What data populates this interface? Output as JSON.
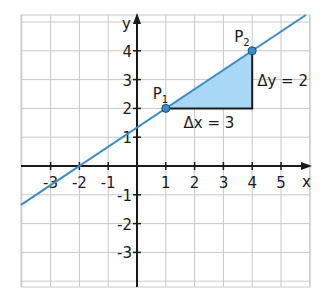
{
  "chart_data": {
    "type": "line",
    "title": "",
    "xlabel": "x",
    "ylabel": "y",
    "xlim": [
      -4.0,
      6.0
    ],
    "ylim": [
      -4.2,
      5.0
    ],
    "grid": true,
    "x_ticks": [
      -3,
      -2,
      -1,
      1,
      2,
      3,
      4,
      5
    ],
    "y_ticks": [
      -3,
      -2,
      -1,
      1,
      2,
      3,
      4
    ],
    "x_tick_labels": [
      "-3",
      "-2",
      "-1",
      "1",
      "2",
      "3",
      "4",
      "5"
    ],
    "y_tick_labels": [
      "-3",
      "-2",
      "-1",
      "1",
      "2",
      "3",
      "4"
    ],
    "line": {
      "slope": 0.6667,
      "intercept": 1.3333,
      "equation": "y = 2/3 x + 4/3",
      "x_intercept": -2,
      "color": "#3a8cc8"
    },
    "points": [
      {
        "name": "P",
        "sub": "1",
        "x": 1,
        "y": 2
      },
      {
        "name": "P",
        "sub": "2",
        "x": 4,
        "y": 4
      }
    ],
    "slope_triangle": {
      "delta_x_label": "Δx = 3",
      "delta_y_label": "Δy = 2",
      "delta_x": 3,
      "delta_y": 2,
      "fill": "#a8d8f4"
    }
  },
  "colors": {
    "grid": "#c8c8c8",
    "axis": "#1a1a1a",
    "line": "#3a8cc8",
    "fill": "#a8d8f4",
    "point": "#3a8cc8"
  }
}
